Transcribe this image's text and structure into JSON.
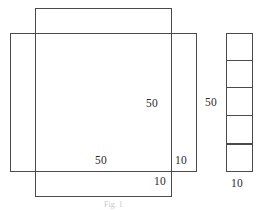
{
  "figure": {
    "stroke_color": "#4a4a4a",
    "background_color": "#ffffff",
    "text_color": "#2b2b2b",
    "shapes": {
      "square_upper": {
        "name": "upper-square",
        "x": 35,
        "y": 8,
        "width": 137,
        "height": 189
      },
      "square_lower": {
        "name": "lower-square",
        "x": 10,
        "y": 33,
        "width": 187,
        "height": 139
      },
      "strip": {
        "name": "stacked-strip",
        "x": 226,
        "y": 33,
        "width": 27,
        "height": 139,
        "cell_count": 5
      }
    },
    "labels": [
      {
        "name": "label-right-50",
        "text": "50",
        "x": 146,
        "y": 97
      },
      {
        "name": "label-bottom-50",
        "text": "50",
        "x": 95,
        "y": 154
      },
      {
        "name": "label-right-10",
        "text": "10",
        "x": 175,
        "y": 154
      },
      {
        "name": "label-bottom-10",
        "text": "10",
        "x": 154,
        "y": 175
      },
      {
        "name": "label-strip-50",
        "text": "50",
        "x": 205,
        "y": 96
      },
      {
        "name": "label-strip-10",
        "text": "10",
        "x": 231,
        "y": 177
      }
    ],
    "caption": {
      "name": "figure-caption",
      "text": "Fig. 1",
      "x": 104,
      "y": 200
    }
  }
}
